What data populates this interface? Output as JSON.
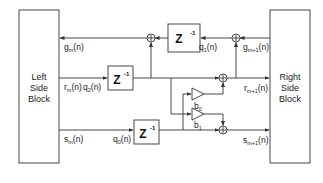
{
  "diagram": {
    "title": "",
    "blocks": {
      "left": {
        "line1": "Left",
        "line2": "Side",
        "line3": "Block"
      },
      "right": {
        "line1": "Right",
        "line2": "Side",
        "line3": "Block"
      }
    },
    "delays": {
      "top": {
        "label": "Z",
        "exp": "-1"
      },
      "middle": {
        "label": "Z",
        "exp": "-1"
      },
      "bottom": {
        "label": "Z",
        "exp": "-1"
      }
    },
    "gains": {
      "b0": {
        "base": "b",
        "sub": "0"
      },
      "b1": {
        "base": "b",
        "sub": "1"
      }
    },
    "signals": {
      "g_m": {
        "base": "g",
        "sub": "m",
        "arg": "(n)"
      },
      "r_m": {
        "base": "r",
        "sub": "m",
        "arg": "(n)"
      },
      "s_m": {
        "base": "s",
        "sub": "m",
        "arg": "(n)"
      },
      "q0": {
        "base": "q",
        "sub": "0",
        "arg": "(n)"
      },
      "q1": {
        "base": "q",
        "sub": "1",
        "arg": "(n)"
      },
      "q2": {
        "base": "q",
        "sub": "2",
        "arg": "(n)"
      },
      "g_m1": {
        "base": "g",
        "sub": "m+1",
        "arg": "(n)"
      },
      "r_m1": {
        "base": "r",
        "sub": "m+1",
        "arg": "(n)"
      },
      "s_m1": {
        "base": "s",
        "sub": "m+1",
        "arg": "(n)"
      }
    },
    "summers": [
      "sum-top-left",
      "sum-top-right",
      "sum-middle",
      "sum-bottom"
    ],
    "colors": {
      "line": "#333333",
      "background": "#ffffff"
    }
  }
}
